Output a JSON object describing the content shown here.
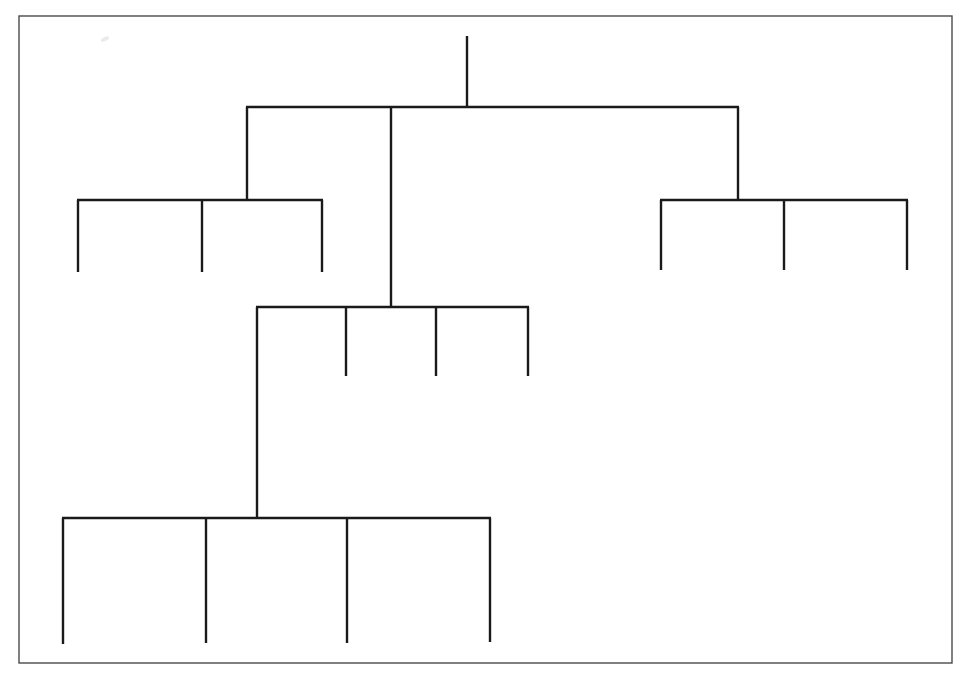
{
  "canvas": {
    "width": 969,
    "height": 675,
    "background_color": "#ffffff"
  },
  "frame": {
    "label": "page-border",
    "x": 19,
    "y": 16,
    "width": 933,
    "height": 647,
    "stroke_color": "#4a4a4a",
    "stroke_width": 1.4
  },
  "style": {
    "line_color": "#1a1a1a",
    "line_width": 2.4,
    "smudge_color": "#b9b9b9"
  },
  "artifact": {
    "name": "scan-smudge",
    "x": 105,
    "y": 39,
    "width": 9,
    "height": 4
  },
  "chart_data": {
    "type": "tree-diagram",
    "title": "",
    "orientation": "top-down",
    "node_count": 0,
    "leaf_count": 13,
    "levels": 4,
    "nodes": [
      {
        "id": "root",
        "label": "",
        "x": 467,
        "y": 36,
        "level": 0
      },
      {
        "id": "root-hub",
        "label": "",
        "x": 467,
        "y": 107,
        "level": 0
      },
      {
        "id": "branch-left",
        "label": "",
        "x": 247,
        "y": 200,
        "level": 1
      },
      {
        "id": "branch-mid",
        "label": "",
        "x": 391,
        "y": 307,
        "level": 1
      },
      {
        "id": "branch-right",
        "label": "",
        "x": 738,
        "y": 200,
        "level": 1
      },
      {
        "id": "mid-left-arm",
        "label": "",
        "x": 258,
        "y": 518,
        "level": 2
      }
    ],
    "groups": [
      {
        "name": "level1-root-bar",
        "bar_y": 107,
        "bar_x1": 247,
        "bar_x2": 738,
        "stem_x": 467,
        "stem_y_top": 36,
        "children_x": [
          247,
          391,
          738
        ]
      },
      {
        "name": "left-subtree",
        "bar_y": 200,
        "bar_x1": 78,
        "bar_x2": 322,
        "stem_x": 247,
        "stem_y_top": 107,
        "leaves_x": [
          78,
          202,
          322
        ],
        "leaf_y_end": 272
      },
      {
        "name": "right-subtree",
        "bar_y": 200,
        "bar_x1": 661,
        "bar_x2": 907,
        "stem_x": 738,
        "stem_y_top": 107,
        "leaves_x": [
          661,
          784,
          907
        ],
        "leaf_y_end": 270
      },
      {
        "name": "centre-subtree",
        "bar_y": 307,
        "bar_x1": 257,
        "bar_x2": 528,
        "stem_x": 391,
        "stem_y_top": 107,
        "leaves_x": [
          346,
          436,
          528
        ],
        "leaf_y_end": 376,
        "extended_arm_x": 257,
        "extended_arm_y_end": 518
      },
      {
        "name": "bottom-subtree",
        "bar_y": 518,
        "bar_x1": 63,
        "bar_x2": 490,
        "stem_x": 257,
        "stem_y_top": 307,
        "leaves_x": [
          63,
          206,
          347,
          490
        ],
        "leaf_y_end": 643
      }
    ],
    "edges": [
      {
        "name": "root-stem",
        "x1": 467,
        "y1": 36,
        "x2": 467,
        "y2": 108
      },
      {
        "name": "level1-bar",
        "x1": 246,
        "y1": 107,
        "x2": 739,
        "y2": 107
      },
      {
        "name": "level1-drop-left",
        "x1": 247,
        "y1": 107,
        "x2": 247,
        "y2": 201
      },
      {
        "name": "level1-drop-centre",
        "x1": 391,
        "y1": 107,
        "x2": 391,
        "y2": 308
      },
      {
        "name": "level1-drop-right",
        "x1": 738,
        "y1": 107,
        "x2": 738,
        "y2": 201
      },
      {
        "name": "left-bar",
        "x1": 77,
        "y1": 200,
        "x2": 323,
        "y2": 200
      },
      {
        "name": "left-leaf-1",
        "x1": 78,
        "y1": 200,
        "x2": 78,
        "y2": 272
      },
      {
        "name": "left-leaf-2",
        "x1": 202,
        "y1": 200,
        "x2": 202,
        "y2": 272
      },
      {
        "name": "left-leaf-3",
        "x1": 322,
        "y1": 200,
        "x2": 322,
        "y2": 272
      },
      {
        "name": "right-bar",
        "x1": 660,
        "y1": 200,
        "x2": 908,
        "y2": 200
      },
      {
        "name": "right-leaf-1",
        "x1": 661,
        "y1": 200,
        "x2": 661,
        "y2": 270
      },
      {
        "name": "right-leaf-2",
        "x1": 784,
        "y1": 200,
        "x2": 784,
        "y2": 270
      },
      {
        "name": "right-leaf-3",
        "x1": 907,
        "y1": 200,
        "x2": 907,
        "y2": 270
      },
      {
        "name": "centre-bar",
        "x1": 256,
        "y1": 307,
        "x2": 529,
        "y2": 307
      },
      {
        "name": "centre-leaf-1",
        "x1": 346,
        "y1": 307,
        "x2": 346,
        "y2": 376
      },
      {
        "name": "centre-leaf-2",
        "x1": 436,
        "y1": 307,
        "x2": 436,
        "y2": 376
      },
      {
        "name": "centre-leaf-3",
        "x1": 528,
        "y1": 307,
        "x2": 528,
        "y2": 376
      },
      {
        "name": "centre-long-arm",
        "x1": 257,
        "y1": 307,
        "x2": 257,
        "y2": 519
      },
      {
        "name": "bottom-bar",
        "x1": 62,
        "y1": 518,
        "x2": 491,
        "y2": 518
      },
      {
        "name": "bottom-leaf-1",
        "x1": 63,
        "y1": 518,
        "x2": 63,
        "y2": 644
      },
      {
        "name": "bottom-leaf-2",
        "x1": 206,
        "y1": 518,
        "x2": 206,
        "y2": 643
      },
      {
        "name": "bottom-leaf-3",
        "x1": 347,
        "y1": 518,
        "x2": 347,
        "y2": 643
      },
      {
        "name": "bottom-leaf-4",
        "x1": 490,
        "y1": 518,
        "x2": 490,
        "y2": 642
      }
    ],
    "labels": [],
    "legend": [],
    "annotations": []
  }
}
